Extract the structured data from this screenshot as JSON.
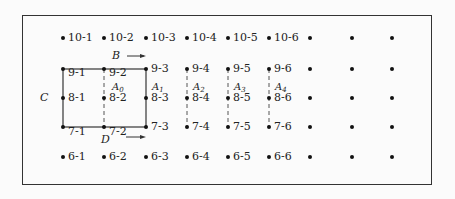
{
  "diagram": {
    "columns_x": [
      63,
      104,
      146,
      187,
      228,
      269,
      310,
      352,
      392
    ],
    "rows": [
      {
        "row": 10,
        "y": 38,
        "labels": [
          "10-1",
          "10-2",
          "10-3",
          "10-4",
          "10-5",
          "10-6",
          "",
          "",
          ""
        ]
      },
      {
        "row": 9,
        "y": 69,
        "labels": [
          "9-1",
          "9-2",
          "9-3",
          "9-4",
          "9-5",
          "9-6",
          "",
          "",
          ""
        ]
      },
      {
        "row": 8,
        "y": 98,
        "labels": [
          "8-1",
          "8-2",
          "8-3",
          "8-4",
          "8-5",
          "8-6",
          "",
          "",
          ""
        ]
      },
      {
        "row": 7,
        "y": 127,
        "labels": [
          "7-1",
          "7-2",
          "7-3",
          "7-4",
          "7-5",
          "7-6",
          "",
          "",
          ""
        ]
      },
      {
        "row": 6,
        "y": 157,
        "labels": [
          "6-1",
          "6-2",
          "6-3",
          "6-4",
          "6-5",
          "6-6",
          "",
          "",
          ""
        ]
      }
    ],
    "area_labels": [
      {
        "text": "A",
        "sub": "0",
        "x": 112,
        "y": 79
      },
      {
        "text": "A",
        "sub": "1",
        "x": 152,
        "y": 79
      },
      {
        "text": "A",
        "sub": "2",
        "x": 193,
        "y": 79
      },
      {
        "text": "A",
        "sub": "3",
        "x": 234,
        "y": 79
      },
      {
        "text": "A",
        "sub": "4",
        "x": 275,
        "y": 79
      }
    ],
    "letters": {
      "B": "B",
      "C": "C",
      "D": "D"
    }
  }
}
